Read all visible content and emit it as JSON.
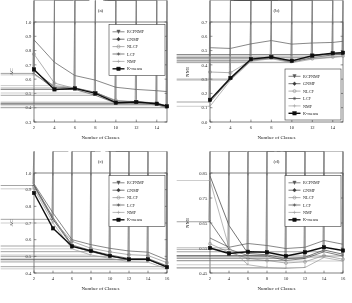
{
  "figure": {
    "xlabel": "Number of Classes",
    "panels": [
      "a",
      "b",
      "c",
      "d"
    ]
  },
  "legend": {
    "entries": [
      {
        "label": "RCPNMF",
        "marker": "triangle",
        "color": "#555555",
        "lw": 0.7
      },
      {
        "label": "GNMF",
        "marker": "diamond",
        "color": "#3a3a3a",
        "lw": 0.7
      },
      {
        "label": "NLCF",
        "marker": "circle",
        "color": "#8e8e8e",
        "lw": 0.7
      },
      {
        "label": "LCF",
        "marker": "star",
        "color": "#4a4a4a",
        "lw": 0.7
      },
      {
        "label": "NMF",
        "marker": "plus",
        "color": "#9a9a9a",
        "lw": 0.7
      },
      {
        "label": "K-means",
        "marker": "square",
        "color": "#111111",
        "lw": 1.4
      }
    ]
  },
  "chart_data": [
    {
      "type": "line",
      "title": "(a)",
      "xlabel": "Number of Classes",
      "ylabel": "AC",
      "x": [
        2,
        4,
        6,
        8,
        10,
        12,
        14,
        15
      ],
      "xlim": [
        2,
        15
      ],
      "xticks": [
        2,
        4,
        6,
        8,
        10,
        12,
        14
      ],
      "ylim": [
        0.3,
        1.0
      ],
      "yticks": [
        0.3,
        0.4,
        0.5,
        0.6,
        0.7,
        0.8,
        0.9,
        1.0
      ],
      "grid": false,
      "legend_position": "top-right",
      "series": [
        {
          "name": "RCPNMF",
          "values": [
            0.875,
            0.718,
            0.625,
            0.593,
            0.543,
            0.528,
            0.519,
            0.513
          ]
        },
        {
          "name": "GNMF",
          "values": [
            0.66,
            0.545,
            0.538,
            0.508,
            0.447,
            0.443,
            0.432,
            0.413
          ]
        },
        {
          "name": "NLCF",
          "values": [
            0.775,
            0.572,
            0.535,
            0.505,
            0.452,
            0.437,
            0.43,
            0.405
          ]
        },
        {
          "name": "LCF",
          "values": [
            0.64,
            0.53,
            0.528,
            0.487,
            0.432,
            0.43,
            0.42,
            0.4
          ]
        },
        {
          "name": "NMF",
          "values": [
            0.63,
            0.555,
            0.54,
            0.503,
            0.44,
            0.425,
            0.422,
            0.403
          ]
        },
        {
          "name": "K-means",
          "values": [
            0.668,
            0.528,
            0.535,
            0.5,
            0.435,
            0.44,
            0.428,
            0.41
          ]
        }
      ]
    },
    {
      "type": "line",
      "title": "(b)",
      "xlabel": "Number of Classes",
      "ylabel": "NMI",
      "x": [
        2,
        4,
        6,
        8,
        10,
        12,
        14,
        15
      ],
      "xlim": [
        2,
        15
      ],
      "xticks": [
        2,
        4,
        6,
        8,
        10,
        12,
        14
      ],
      "ylim": [
        0.0,
        0.7
      ],
      "yticks": [
        0.0,
        0.1,
        0.2,
        0.3,
        0.4,
        0.5,
        0.6,
        0.7
      ],
      "grid": false,
      "legend_position": "bottom-right",
      "series": [
        {
          "name": "RCPNMF",
          "values": [
            0.52,
            0.515,
            0.547,
            0.57,
            0.545,
            0.553,
            0.557,
            0.565
          ]
        },
        {
          "name": "GNMF",
          "values": [
            0.15,
            0.302,
            0.437,
            0.452,
            0.425,
            0.462,
            0.478,
            0.482
          ]
        },
        {
          "name": "NLCF",
          "values": [
            0.35,
            0.345,
            0.432,
            0.448,
            0.432,
            0.443,
            0.455,
            0.462
          ]
        },
        {
          "name": "LCF",
          "values": [
            0.14,
            0.3,
            0.43,
            0.448,
            0.418,
            0.45,
            0.47,
            0.472
          ]
        },
        {
          "name": "NMF",
          "values": [
            0.11,
            0.292,
            0.425,
            0.443,
            0.415,
            0.44,
            0.452,
            0.458
          ]
        },
        {
          "name": "K-means",
          "values": [
            0.155,
            0.308,
            0.44,
            0.455,
            0.428,
            0.465,
            0.482,
            0.485
          ]
        }
      ]
    },
    {
      "type": "line",
      "title": "(c)",
      "xlabel": "Number of Classes",
      "ylabel": "AC",
      "x": [
        2,
        4,
        6,
        8,
        10,
        12,
        14,
        16
      ],
      "xlim": [
        2,
        16
      ],
      "xticks": [
        2,
        4,
        6,
        8,
        10,
        12,
        14,
        16
      ],
      "ylim": [
        0.4,
        1.0
      ],
      "yticks": [
        0.4,
        0.5,
        0.6,
        0.7,
        0.8,
        0.9,
        1.0
      ],
      "grid": false,
      "legend_position": "top-right",
      "series": [
        {
          "name": "RCPNMF",
          "values": [
            0.935,
            0.76,
            0.6,
            0.57,
            0.548,
            0.532,
            0.525,
            0.478
          ]
        },
        {
          "name": "GNMF",
          "values": [
            0.928,
            0.733,
            0.568,
            0.535,
            0.508,
            0.487,
            0.487,
            0.443
          ]
        },
        {
          "name": "NLCF",
          "values": [
            0.918,
            0.718,
            0.59,
            0.548,
            0.527,
            0.51,
            0.505,
            0.462
          ]
        },
        {
          "name": "LCF",
          "values": [
            0.925,
            0.722,
            0.562,
            0.528,
            0.5,
            0.48,
            0.48,
            0.438
          ]
        },
        {
          "name": "NMF",
          "values": [
            0.905,
            0.7,
            0.545,
            0.508,
            0.488,
            0.468,
            0.465,
            0.425
          ]
        },
        {
          "name": "K-means",
          "values": [
            0.88,
            0.668,
            0.56,
            0.532,
            0.503,
            0.482,
            0.482,
            0.435
          ]
        }
      ]
    },
    {
      "type": "line",
      "title": "(d)",
      "xlabel": "Number of Classes",
      "ylabel": "NMI",
      "x": [
        2,
        4,
        6,
        8,
        10,
        12,
        14,
        16
      ],
      "xlim": [
        2,
        16
      ],
      "xticks": [
        2,
        4,
        6,
        8,
        10,
        12,
        14,
        16
      ],
      "ylim": [
        0.45,
        0.85
      ],
      "yticks": [
        0.45,
        0.55,
        0.65,
        0.75,
        0.85
      ],
      "grid": false,
      "legend_position": "top-right",
      "series": [
        {
          "name": "RCPNMF",
          "values": [
            0.59,
            0.553,
            0.568,
            0.56,
            0.548,
            0.553,
            0.58,
            0.565
          ]
        },
        {
          "name": "GNMF",
          "values": [
            0.838,
            0.64,
            0.528,
            0.523,
            0.508,
            0.513,
            0.542,
            0.525
          ]
        },
        {
          "name": "NLCF",
          "values": [
            0.567,
            0.533,
            0.508,
            0.5,
            0.49,
            0.495,
            0.52,
            0.505
          ]
        },
        {
          "name": "LCF",
          "values": [
            0.655,
            0.545,
            0.52,
            0.518,
            0.5,
            0.508,
            0.535,
            0.518
          ]
        },
        {
          "name": "NMF",
          "values": [
            0.82,
            0.552,
            0.483,
            0.472,
            0.468,
            0.472,
            0.512,
            0.498
          ]
        },
        {
          "name": "K-means",
          "values": [
            0.55,
            0.528,
            0.535,
            0.533,
            0.518,
            0.533,
            0.553,
            0.54
          ]
        }
      ]
    }
  ]
}
